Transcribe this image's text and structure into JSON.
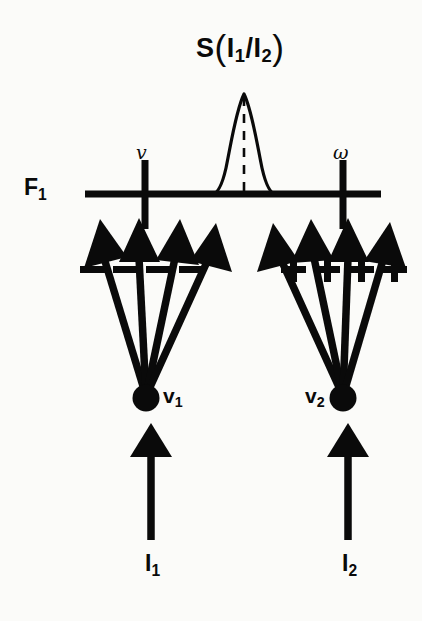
{
  "figure": {
    "title": "S(I1/I2)",
    "title_parts": {
      "s": "S",
      "open_paren": "(",
      "numerator": "I",
      "numerator_sub": "1",
      "slash": "/",
      "denominator": "I",
      "denominator_sub": "2",
      "close_paren": ")"
    },
    "background_color": "#fbfbf9",
    "ink_color": "#0a0a0a"
  },
  "axis": {
    "name": "F",
    "name_sub": "1",
    "label": "F1",
    "line": {
      "x1": 85,
      "x2": 381,
      "y": 194,
      "thickness": 7
    },
    "ticks": [
      {
        "id": "tick-nu",
        "label": "v",
        "x": 145,
        "y_top": 160,
        "y_bottom": 228
      },
      {
        "id": "tick-omega",
        "label": "ω",
        "x": 343,
        "y_top": 160,
        "y_bottom": 228
      }
    ]
  },
  "peak": {
    "name": "signal-peak",
    "center_x": 244,
    "base_y": 194,
    "apex_y": 93,
    "half_width": 32,
    "dashed_center_line": true
  },
  "nodes": [
    {
      "id": "node-v1",
      "label": "v",
      "label_sub": "1",
      "label_full": "v1",
      "cx": 146,
      "cy": 398,
      "r": 13,
      "sign": "−",
      "sign_name": "minus",
      "fan_count": 4
    },
    {
      "id": "node-v2",
      "label": "v",
      "label_sub": "2",
      "label_full": "v2",
      "cx": 343,
      "cy": 398,
      "r": 13,
      "sign": "+",
      "sign_name": "plus",
      "fan_count": 4
    }
  ],
  "fan_left": {
    "sign_row_y": 270,
    "signs": [
      "−",
      "−",
      "−",
      "−"
    ],
    "sign_x": [
      93,
      126,
      159,
      192
    ],
    "arrow_tips": [
      {
        "x": 100,
        "y": 224
      },
      {
        "x": 139,
        "y": 222
      },
      {
        "x": 178,
        "y": 224
      },
      {
        "x": 212,
        "y": 231
      }
    ]
  },
  "fan_right": {
    "sign_row_y": 270,
    "signs": [
      "+",
      "+",
      "+",
      "+"
    ],
    "sign_x": [
      293,
      327,
      361,
      394
    ],
    "arrow_tips": [
      {
        "x": 276,
        "y": 231
      },
      {
        "x": 311,
        "y": 224
      },
      {
        "x": 348,
        "y": 222
      },
      {
        "x": 387,
        "y": 226
      }
    ]
  },
  "inputs": [
    {
      "id": "input-i1",
      "label": "I",
      "label_sub": "1",
      "label_full": "I1",
      "x": 151,
      "tip_y": 424,
      "tail_y": 540
    },
    {
      "id": "input-i2",
      "label": "I",
      "label_sub": "2",
      "label_full": "I2",
      "x": 348,
      "tip_y": 424,
      "tail_y": 540
    }
  ]
}
